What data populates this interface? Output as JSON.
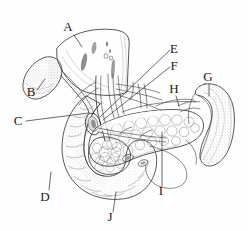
{
  "figure": {
    "width": 248,
    "height": 231,
    "background_color": "#fefefe",
    "ink_color": "#3a3a3a",
    "label_color": "#1a1a1a",
    "style": "pen-and-ink stipple / hatched medical illustration"
  },
  "labels": [
    {
      "id": "A",
      "text": "A",
      "x": 68,
      "y": 31,
      "anchor": "middle"
    },
    {
      "id": "B",
      "text": "B",
      "x": 31,
      "y": 96,
      "anchor": "middle"
    },
    {
      "id": "C",
      "text": "C",
      "x": 18,
      "y": 125,
      "anchor": "middle"
    },
    {
      "id": "D",
      "text": "D",
      "x": 45,
      "y": 201,
      "anchor": "middle"
    },
    {
      "id": "E",
      "text": "E",
      "x": 174,
      "y": 53,
      "anchor": "middle"
    },
    {
      "id": "F",
      "text": "F",
      "x": 174,
      "y": 70,
      "anchor": "middle"
    },
    {
      "id": "G",
      "text": "G",
      "x": 208,
      "y": 81,
      "anchor": "middle"
    },
    {
      "id": "H",
      "text": "H",
      "x": 174,
      "y": 93,
      "anchor": "middle"
    },
    {
      "id": "I",
      "text": "I",
      "x": 161,
      "y": 195,
      "anchor": "middle"
    },
    {
      "id": "J",
      "text": "J",
      "x": 110,
      "y": 221,
      "anchor": "middle"
    }
  ],
  "leader_lines": [
    {
      "id": "A",
      "path": "M 74 35 L 82 47"
    },
    {
      "id": "B",
      "path": "M 37 90 L 45 79"
    },
    {
      "id": "C",
      "path": "M 26 121 L 89 113"
    },
    {
      "id": "D",
      "path": "M 49 190 L 51 172"
    },
    {
      "id": "E",
      "path": "M 170 50 L 100 117"
    },
    {
      "id": "F",
      "path": "M 170 67 L 103 120"
    },
    {
      "id": "G",
      "path": "M 209 84 L 209 96"
    },
    {
      "id": "H",
      "path": "M 176 96 L 179 106"
    },
    {
      "id": "I",
      "path": "M 162 186 L 162 132"
    },
    {
      "id": "J",
      "path": "M 113 212 L 116 192"
    }
  ]
}
